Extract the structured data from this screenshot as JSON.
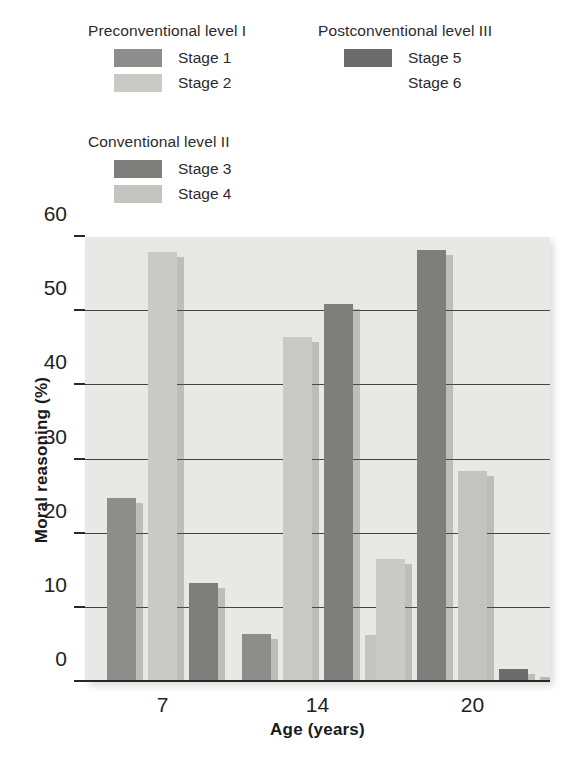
{
  "legend": {
    "groups": [
      {
        "id": "preconventional",
        "heading": "Preconventional level I",
        "entries": [
          {
            "label": "Stage 1",
            "color": "#8d8d8b",
            "swatch": true
          },
          {
            "label": "Stage 2",
            "color": "#c9c9c5",
            "swatch": true
          }
        ]
      },
      {
        "id": "conventional",
        "heading": "Conventional level II",
        "entries": [
          {
            "label": "Stage 3",
            "color": "#7e7e7c",
            "swatch": true
          },
          {
            "label": "Stage 4",
            "color": "#c3c3bf",
            "swatch": true
          }
        ]
      },
      {
        "id": "postconventional",
        "heading": "Postconventional level III",
        "entries": [
          {
            "label": "Stage 5",
            "color": "#6c6c6a",
            "swatch": true
          },
          {
            "label": "Stage 6",
            "color": "#e3e3df",
            "swatch": false
          }
        ]
      }
    ]
  },
  "chart_data": {
    "type": "bar",
    "title": "",
    "xlabel": "Age (years)",
    "ylabel": "Moral reasoning (%)",
    "categories": [
      "7",
      "14",
      "20"
    ],
    "ylim": [
      0,
      60
    ],
    "yticks": [
      0,
      10,
      20,
      30,
      40,
      50,
      60
    ],
    "ytick_labels": [
      "0",
      "10",
      "20",
      "30",
      "40",
      "50",
      "60"
    ],
    "grid": true,
    "grid_axis": "y",
    "legend_position": "above-plot",
    "series": [
      {
        "name": "Stage 1",
        "color": "#8d8d8b",
        "values": [
          24.8,
          6.5,
          0
        ]
      },
      {
        "name": "Stage 2",
        "color": "#c9c9c5",
        "values": [
          58.0,
          46.5,
          16.6
        ]
      },
      {
        "name": "Stage 3",
        "color": "#7e7e7c",
        "values": [
          13.3,
          51.0,
          58.3
        ]
      },
      {
        "name": "Stage 4",
        "color": "#c3c3bf",
        "values": [
          0,
          6.4,
          28.5
        ]
      },
      {
        "name": "Stage 5",
        "color": "#6c6c6a",
        "values": [
          0,
          0,
          1.8
        ]
      },
      {
        "name": "Stage 6",
        "color": "#b9b9b5",
        "values": [
          0,
          0,
          0.7
        ]
      }
    ]
  }
}
